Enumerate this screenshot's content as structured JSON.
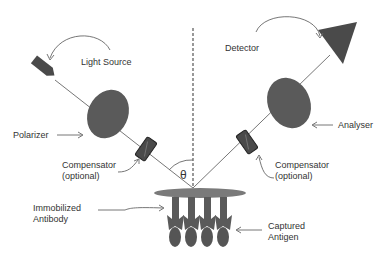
{
  "diagram": {
    "labels": {
      "light_source": "Light Source",
      "detector": "Detector",
      "polarizer": "Polarizer",
      "analyser": "Analyser",
      "compensator_left_1": "Compensator",
      "compensator_left_2": "(optional)",
      "compensator_right_1": "Compensator",
      "compensator_right_2": "(optional)",
      "theta": "θ",
      "immobilized_1": "Immobilized",
      "immobilized_2": "Antibody",
      "captured_1": "Captured",
      "captured_2": "Antigen"
    },
    "colors": {
      "component_fill": "#555555",
      "beam": "#666666",
      "surface": "#7a7a7a",
      "text": "#333333"
    }
  }
}
